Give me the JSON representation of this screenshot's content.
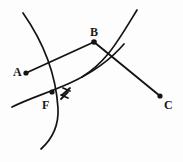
{
  "figure": {
    "type": "geometry-diagram",
    "background_color": "#fdfdfd",
    "stroke_color": "#141414",
    "width": 183,
    "height": 162
  },
  "points": [
    {
      "id": "A",
      "label": "A",
      "dot_x": 26,
      "dot_y": 73,
      "label_x": 13,
      "label_y": 66
    },
    {
      "id": "B",
      "label": "B",
      "dot_x": 94,
      "dot_y": 42,
      "label_x": 90,
      "label_y": 26
    },
    {
      "id": "C",
      "label": "C",
      "dot_x": 160,
      "dot_y": 96,
      "label_x": 164,
      "label_y": 99
    },
    {
      "id": "F",
      "label": "F",
      "dot_x": 52,
      "dot_y": 92,
      "label_x": 42,
      "label_y": 99
    }
  ],
  "segments": [
    {
      "id": "AB",
      "from": "A",
      "to": "B",
      "x1": 26,
      "y1": 73,
      "x2": 94,
      "y2": 42
    },
    {
      "id": "BC",
      "from": "B",
      "to": "C",
      "x1": 94,
      "y1": 42,
      "x2": 160,
      "y2": 96
    }
  ],
  "arcs": [
    {
      "id": "left-arc",
      "description": "long arc bowing right, running top to bottom through F",
      "path": "M 23 13 C 44 43, 56 76, 58 108 C 59 127, 51 140, 41 149"
    },
    {
      "id": "right-arc",
      "description": "arc bowing right, running from upper right down to lower left",
      "path": "M 137 10 C 126 28, 118 42, 108 54 C 99 65, 90 72, 82 77"
    },
    {
      "id": "lower-arc",
      "description": "shallow arc from lower left rising to the right past F",
      "path": "M 12 107 C 30 98, 48 93, 70 83 C 92 73, 112 58, 124 44"
    }
  ],
  "symbols": [
    {
      "id": "lightning-bolt",
      "name": "lightning-bolt-icon",
      "x": 62,
      "y": 92,
      "description": "small zigzag lightning bolt marking the intersection near F",
      "paths": [
        "M 70 88 L 62 95",
        "M 68 92 L 61 99",
        "M 63 88 L 70 91",
        "M 61 95 L 68 98"
      ]
    }
  ],
  "labels": {
    "A": "A",
    "B": "B",
    "C": "C",
    "F": "F"
  }
}
